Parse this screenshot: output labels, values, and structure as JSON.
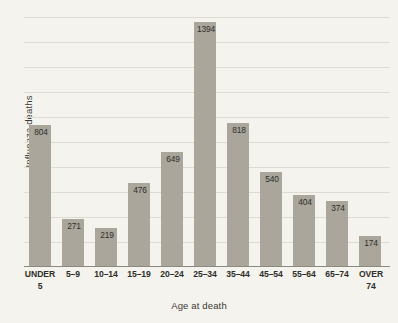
{
  "chart_data": {
    "type": "bar",
    "title": "",
    "xlabel": "Age at death",
    "ylabel": "Influenza deaths",
    "categories": [
      "UNDER 5",
      "5–9",
      "10–14",
      "15–19",
      "20–24",
      "25–34",
      "35–44",
      "45–54",
      "55–64",
      "65–74",
      "OVER 74"
    ],
    "values": [
      804,
      271,
      219,
      476,
      649,
      1394,
      818,
      540,
      404,
      374,
      174
    ],
    "data_labels": [
      "804",
      "271",
      "219",
      "476",
      "649",
      "1394",
      "818",
      "540",
      "404",
      "374",
      "174"
    ],
    "ylim": [
      0,
      1440
    ],
    "grid": true,
    "gridlines": 10,
    "legend": "none",
    "bar_color": "#aaa69c",
    "background_color": "#f5f3ed",
    "gridline_color": "#dedbd2",
    "axis_color": "#8c8a80",
    "text_color": "#2e2e2a"
  },
  "axes": {
    "x_tick_lines": [
      {
        "l1": "UNDER",
        "l2": "5"
      },
      {
        "l1": "5–9",
        "l2": ""
      },
      {
        "l1": "10–14",
        "l2": ""
      },
      {
        "l1": "15–19",
        "l2": ""
      },
      {
        "l1": "20–24",
        "l2": ""
      },
      {
        "l1": "25–34",
        "l2": ""
      },
      {
        "l1": "35–44",
        "l2": ""
      },
      {
        "l1": "45–54",
        "l2": ""
      },
      {
        "l1": "55–64",
        "l2": ""
      },
      {
        "l1": "65–74",
        "l2": ""
      },
      {
        "l1": "OVER",
        "l2": "74"
      }
    ]
  }
}
